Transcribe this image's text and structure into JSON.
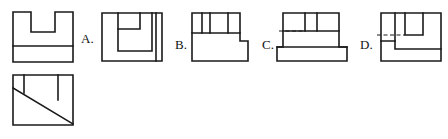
{
  "page": {
    "background": "#ffffff",
    "line_color": "#1a1a1a",
    "width": 448,
    "height": 139,
    "kind": "engineering-drawing-multiple-choice"
  },
  "given_views": {
    "front_view": {
      "name": "front-view-u-shape",
      "description": "U-shaped front view with horizontal line near bottom",
      "box": {
        "x": 13,
        "y": 12,
        "w": 60,
        "h": 50
      },
      "outline_points": "13,12 13,62 73,62 73,12 55,12 55,32 31,32 31,12 13,12",
      "interior_lines": [
        {
          "x1": 13,
          "y1": 46,
          "x2": 73,
          "y2": 46
        }
      ]
    },
    "top_view": {
      "name": "top-view-with-diagonal",
      "description": "Rectangle with two partial vertical lines and a diagonal",
      "box": {
        "x": 13,
        "y": 75,
        "w": 60,
        "h": 50
      },
      "interior_lines": [
        {
          "x1": 24,
          "y1": 75,
          "x2": 24,
          "y2": 93
        },
        {
          "x1": 58,
          "y1": 75,
          "x2": 58,
          "y2": 100
        },
        {
          "x1": 13,
          "y1": 88,
          "x2": 73,
          "y2": 124
        }
      ]
    }
  },
  "options": [
    {
      "id": "A",
      "label": "A.",
      "label_pos": {
        "x": 81,
        "y": 32
      },
      "view_box": {
        "x": 102,
        "y": 13,
        "w": 60,
        "h": 48
      },
      "description": "Square outline with nested inner rectangles and a narrow vertical slot at right"
    },
    {
      "id": "B",
      "label": "B.",
      "label_pos": {
        "x": 175,
        "y": 38
      },
      "view_box": {
        "x": 192,
        "y": 13,
        "w": 58,
        "h": 48
      },
      "description": "Top strip divided by three vertical lines over a stepped body"
    },
    {
      "id": "C",
      "label": "C.",
      "label_pos": {
        "x": 262,
        "y": 38
      },
      "view_box": {
        "x": 283,
        "y": 13,
        "w": 60,
        "h": 48
      },
      "description": "Notched top with two vertical ribs, hidden dashed line, stepped sides"
    },
    {
      "id": "D",
      "label": "D.",
      "label_pos": {
        "x": 360,
        "y": 38
      },
      "view_box": {
        "x": 381,
        "y": 13,
        "w": 58,
        "h": 48
      },
      "description": "Nested rectangle with hidden dashed line and lower-left step"
    }
  ]
}
